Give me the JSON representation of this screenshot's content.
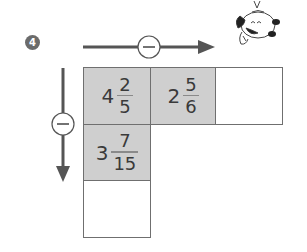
{
  "problem": {
    "number": "4",
    "operation_symbol": "−",
    "horizontal_operation": "subtract",
    "vertical_operation": "subtract"
  },
  "colors": {
    "badge": "#6b6b6b",
    "arrow": "#555555",
    "shaded_cell": "#cfcfcf",
    "grid_border": "#6f6f6f"
  },
  "grid": {
    "rows": [
      [
        {
          "whole": "4",
          "numerator": "2",
          "denominator": "5",
          "shaded": true
        },
        {
          "whole": "2",
          "numerator": "5",
          "denominator": "6",
          "shaded": true
        },
        {
          "whole": "",
          "numerator": "",
          "denominator": "",
          "shaded": false,
          "answer_blank": true
        }
      ],
      [
        {
          "whole": "3",
          "numerator": "7",
          "denominator": "15",
          "shaded": true
        }
      ],
      [
        {
          "whole": "",
          "numerator": "",
          "denominator": "",
          "shaded": false,
          "answer_blank": true
        }
      ]
    ]
  },
  "icons": {
    "horizontal_op": "minus-circle-icon",
    "vertical_op": "minus-circle-icon",
    "mascot": "cartoon-puppy-icon"
  }
}
